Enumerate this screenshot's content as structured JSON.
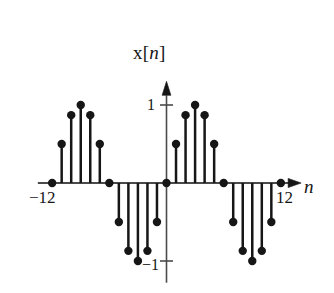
{
  "figure": {
    "kind": "stem-plot",
    "title": "x[n]",
    "title_prefix": "x[",
    "title_var": "n",
    "title_suffix": "]",
    "axis_label_x": "n",
    "background_color": "#ffffff",
    "ink_color": "#161616",
    "axis_color": "#4a4a4a"
  },
  "labels": {
    "y_tick_positive": "1",
    "y_tick_negative": "−1",
    "x_tick_left": "−12",
    "x_tick_right": "12"
  },
  "chart_data": {
    "type": "scatter",
    "plot_style": "stem",
    "title": "x[n]",
    "xlabel": "n",
    "ylabel": "x[n]",
    "xlim": [
      -13.5,
      13.5
    ],
    "ylim": [
      -1.15,
      1.15
    ],
    "grid": false,
    "legend": null,
    "expression": "x[n] = sin(pi*n/6)",
    "period": 12,
    "xticks": [
      -12,
      12
    ],
    "xtick_labels": [
      "−12",
      "12"
    ],
    "yticks": [
      -1,
      1
    ],
    "ytick_labels": [
      "−1",
      "1"
    ],
    "x": [
      -12,
      -11,
      -10,
      -9,
      -8,
      -7,
      -6,
      -5,
      -4,
      -3,
      -2,
      -1,
      0,
      1,
      2,
      3,
      4,
      5,
      6,
      7,
      8,
      9,
      10,
      11,
      12
    ],
    "y": [
      0,
      0.5,
      0.87,
      1,
      0.87,
      0.5,
      0,
      -0.5,
      -0.87,
      -1,
      -0.87,
      -0.5,
      0,
      0.5,
      0.87,
      1,
      0.87,
      0.5,
      0,
      -0.5,
      -0.87,
      -1,
      -0.87,
      -0.5,
      0
    ],
    "zero_crossings": [
      -12,
      -6,
      0,
      6,
      12
    ],
    "peaks": [
      -9,
      3
    ],
    "troughs": [
      -3,
      9
    ]
  }
}
